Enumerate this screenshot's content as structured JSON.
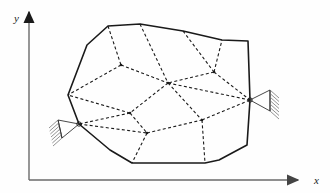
{
  "figure": {
    "type": "engineering-diagram",
    "background_color": "#fefefe",
    "outline_color": "#1a1a1a",
    "mesh_color": "#1a1a1a",
    "axis_color": "#555555"
  },
  "axes": {
    "x_label": "x",
    "y_label": "y",
    "origin": [
      29,
      180
    ],
    "x_axis_end": [
      298,
      180
    ],
    "y_axis_end": [
      29,
      12
    ],
    "x_label_pos": [
      314,
      184
    ],
    "y_label_pos": [
      14,
      22
    ]
  },
  "body": {
    "name": "polygonal-body",
    "outline_style": "solid",
    "vertices": [
      [
        87,
        45
      ],
      [
        108,
        26
      ],
      [
        140,
        24
      ],
      [
        183,
        31
      ],
      [
        222,
        40
      ],
      [
        248,
        41
      ],
      [
        250,
        100
      ],
      [
        247,
        145
      ],
      [
        219,
        160
      ],
      [
        205,
        163
      ],
      [
        132,
        163
      ],
      [
        110,
        150
      ],
      [
        79,
        124
      ],
      [
        68,
        95
      ]
    ]
  },
  "mesh": {
    "name": "finite-element-mesh",
    "line_style": "dashed",
    "nodes": [
      {
        "id": "n_top_1",
        "pos": [
          108,
          26
        ],
        "on_boundary": true
      },
      {
        "id": "n_top_2",
        "pos": [
          140,
          24
        ],
        "on_boundary": true
      },
      {
        "id": "n_top_3",
        "pos": [
          183,
          31
        ],
        "on_boundary": true
      },
      {
        "id": "n_top_4",
        "pos": [
          222,
          40
        ],
        "on_boundary": true
      },
      {
        "id": "n_left_1",
        "pos": [
          68,
          95
        ],
        "on_boundary": true
      },
      {
        "id": "n_left_2",
        "pos": [
          79,
          124
        ],
        "on_boundary": true
      },
      {
        "id": "n_bot_1",
        "pos": [
          132,
          163
        ],
        "on_boundary": true
      },
      {
        "id": "n_bot_2",
        "pos": [
          205,
          163
        ],
        "on_boundary": true
      },
      {
        "id": "n_right_1",
        "pos": [
          250,
          100
        ],
        "on_boundary": true
      },
      {
        "id": "n_int_1",
        "pos": [
          121,
          65
        ],
        "on_boundary": false
      },
      {
        "id": "n_int_2",
        "pos": [
          168,
          83
        ],
        "on_boundary": false
      },
      {
        "id": "n_int_3",
        "pos": [
          214,
          72
        ],
        "on_boundary": false
      },
      {
        "id": "n_int_4",
        "pos": [
          130,
          113
        ],
        "on_boundary": false
      },
      {
        "id": "n_int_5",
        "pos": [
          202,
          120
        ],
        "on_boundary": false
      },
      {
        "id": "n_int_6",
        "pos": [
          147,
          133
        ],
        "on_boundary": false
      }
    ],
    "edges": [
      [
        "n_top_1",
        "n_int_1"
      ],
      [
        "n_int_1",
        "n_left_1"
      ],
      [
        "n_int_1",
        "n_int_2"
      ],
      [
        "n_top_2",
        "n_int_2"
      ],
      [
        "n_top_3",
        "n_int_3"
      ],
      [
        "n_int_3",
        "n_int_2"
      ],
      [
        "n_int_3",
        "n_top_4"
      ],
      [
        "n_int_3",
        "n_right_1"
      ],
      [
        "n_int_2",
        "n_right_1"
      ],
      [
        "n_int_2",
        "n_int_4"
      ],
      [
        "n_int_2",
        "n_int_5"
      ],
      [
        "n_int_4",
        "n_left_1"
      ],
      [
        "n_int_4",
        "n_left_2"
      ],
      [
        "n_int_4",
        "n_int_6"
      ],
      [
        "n_left_2",
        "n_int_6"
      ],
      [
        "n_int_6",
        "n_int_5"
      ],
      [
        "n_int_5",
        "n_right_1"
      ],
      [
        "n_int_6",
        "n_bot_1"
      ],
      [
        "n_int_5",
        "n_bot_2"
      ]
    ]
  },
  "supports": [
    {
      "id": "support-left",
      "type": "pin-support",
      "node_pos": [
        79,
        124
      ],
      "label": "",
      "hatch_side": "left",
      "triangle": [
        [
          79,
          124
        ],
        [
          58,
          120
        ],
        [
          62,
          138
        ]
      ],
      "hatch_lines": 6
    },
    {
      "id": "support-right",
      "type": "pin-support",
      "node_pos": [
        250,
        100
      ],
      "label": "",
      "hatch_side": "right",
      "triangle": [
        [
          250,
          100
        ],
        [
          270,
          90
        ],
        [
          270,
          111
        ]
      ],
      "hatch_lines": 6
    }
  ]
}
